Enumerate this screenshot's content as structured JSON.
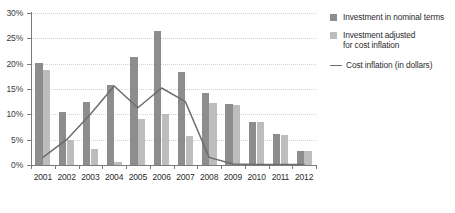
{
  "chart_data": {
    "type": "bar",
    "title": "",
    "xlabel": "",
    "ylabel": "",
    "ylim": [
      0,
      30
    ],
    "yticks": [
      "0%",
      "5%",
      "10%",
      "15%",
      "20%",
      "25%",
      "30%"
    ],
    "ytick_values": [
      0,
      5,
      10,
      15,
      20,
      25,
      30
    ],
    "grid": true,
    "legend_position": "right",
    "categories": [
      "2001",
      "2002",
      "2003",
      "2004",
      "2005",
      "2006",
      "2007",
      "2008",
      "2009",
      "2010",
      "2011",
      "2012"
    ],
    "series": [
      {
        "name": "Investment in nominal terms",
        "type": "bar",
        "color": "#8d8d8d",
        "values": [
          20.2,
          10.5,
          12.4,
          15.7,
          21.3,
          26.5,
          18.4,
          14.3,
          12.0,
          8.5,
          6.1,
          2.8
        ]
      },
      {
        "name": "Investment adjusted for cost inflation",
        "type": "bar",
        "color": "#bdbdbd",
        "values": [
          18.7,
          5.0,
          3.2,
          0.5,
          9.1,
          10.0,
          5.8,
          12.3,
          11.9,
          8.5,
          6.0,
          2.8
        ]
      },
      {
        "name": "Cost inflation (in dollars)",
        "type": "line",
        "color": "#6d6d6d",
        "values": [
          1.5,
          5.0,
          10.0,
          15.6,
          11.3,
          15.2,
          12.5,
          1.5,
          0.2,
          0.1,
          0.1,
          0.1
        ]
      }
    ]
  },
  "legend": {
    "items": [
      {
        "label_line1": "Investment in nominal terms",
        "label_line2": "",
        "marker": "square-dark"
      },
      {
        "label_line1": "Investment adjusted",
        "label_line2": "for cost inflation",
        "marker": "square-light"
      },
      {
        "label_line1": "Cost inflation (in dollars)",
        "label_line2": "",
        "marker": "line"
      }
    ]
  },
  "caption": {
    "source_text": ""
  },
  "colors": {
    "nominal": "#8d8d8d",
    "adjusted": "#bdbdbd",
    "line": "#6d6d6d",
    "axis": "#7a7a7a",
    "grid": "#d2d2d2"
  }
}
